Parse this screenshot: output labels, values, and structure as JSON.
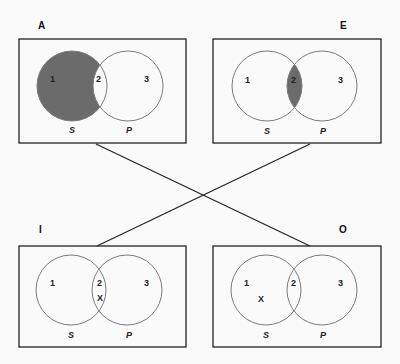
{
  "diagram": {
    "colors": {
      "background": "#fafafa",
      "box_stroke": "#222222",
      "circle_stroke": "#7a7a7a",
      "shade": "#6b6b6b",
      "line": "#222222"
    },
    "panels": [
      {
        "id": "A",
        "corner_label": "A",
        "regions": [
          "1",
          "2",
          "3"
        ],
        "sets": {
          "left": "S",
          "right": "P"
        },
        "shaded": [
          "1"
        ],
        "x_mark": null
      },
      {
        "id": "E",
        "corner_label": "E",
        "regions": [
          "1",
          "2",
          "3"
        ],
        "sets": {
          "left": "S",
          "right": "P"
        },
        "shaded": [
          "2"
        ],
        "x_mark": null
      },
      {
        "id": "I",
        "corner_label": "I",
        "regions": [
          "1",
          "2",
          "3"
        ],
        "sets": {
          "left": "S",
          "right": "P"
        },
        "shaded": [],
        "x_mark": "X",
        "x_region": "2"
      },
      {
        "id": "O",
        "corner_label": "O",
        "regions": [
          "1",
          "2",
          "3"
        ],
        "sets": {
          "left": "S",
          "right": "P"
        },
        "shaded": [],
        "x_mark": "X",
        "x_region": "1"
      }
    ],
    "connectors": [
      {
        "from": "A",
        "to": "O",
        "label": "contradictory"
      },
      {
        "from": "E",
        "to": "I",
        "label": "contradictory"
      }
    ]
  }
}
